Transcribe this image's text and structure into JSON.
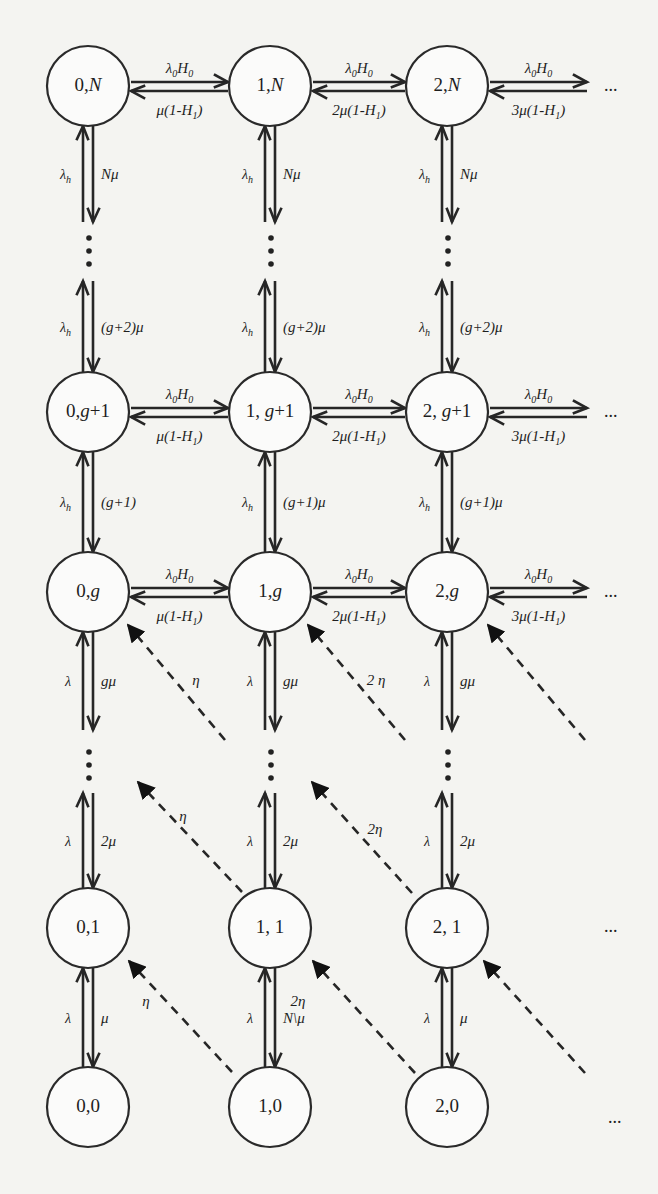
{
  "diagram": {
    "colors": {
      "background": "#f4f4f1",
      "stroke": "#262626",
      "node_fill": "#fbfbfa"
    },
    "columns_x": [
      88,
      270,
      447
    ],
    "rows": [
      {
        "id": "N",
        "y": 86,
        "labels": [
          "0,N",
          "1,N",
          "2,N"
        ]
      },
      {
        "id": "g+1",
        "y": 412,
        "labels": [
          "0,g+1",
          "1, g+1",
          "2, g+1"
        ]
      },
      {
        "id": "g",
        "y": 592,
        "labels": [
          "0,g",
          "1,g",
          "2,g"
        ]
      },
      {
        "id": "1",
        "y": 928,
        "labels": [
          "0,1",
          "1, 1",
          "2, 1"
        ]
      },
      {
        "id": "0",
        "y": 1107,
        "labels": [
          "0,0",
          "1,0",
          "2,0"
        ]
      }
    ],
    "horizontal_rates": {
      "N": {
        "forward": [
          "λ0H0",
          "λ0H0",
          "λ0H0"
        ],
        "backward": [
          "μ(1-H1)",
          "2μ(1-H1)",
          "3μ(1-H1)"
        ]
      },
      "g+1": {
        "forward": [
          "λ0H0",
          "λ0H0",
          "λ0H0"
        ],
        "backward": [
          "μ(1-H1)",
          "2μ(1-H1)",
          "3μ(1-H1)"
        ]
      },
      "g": {
        "forward": [
          "λ0H0",
          "λ0H0",
          "λ0H0"
        ],
        "backward": [
          "μ(1-H1)",
          "2μ(1-H1)",
          "3μ(1-H1)"
        ]
      }
    },
    "vertical_rates": {
      "N_to_dots": {
        "up": [
          "λh",
          "λh",
          "λh"
        ],
        "down": [
          "Nμ",
          "Nμ",
          "Nμ"
        ]
      },
      "dots_to_g+1": {
        "up": [
          "λh",
          "λh",
          "λh"
        ],
        "down": [
          "(g+2)μ",
          "(g+2)μ",
          "(g+2)μ"
        ]
      },
      "g+1_to_g": {
        "up": [
          "λh",
          "λh",
          "λh"
        ],
        "down": [
          "(g+1)",
          "(g+1)μ",
          "(g+1)μ"
        ]
      },
      "g_to_dots": {
        "up": [
          "λ",
          "λ",
          "λ"
        ],
        "down": [
          "gμ",
          "gμ",
          "gμ"
        ]
      },
      "dots_to_1": {
        "up": [
          "λ",
          "λ",
          "λ"
        ],
        "down": [
          "2μ",
          "2μ",
          "2μ"
        ]
      },
      "1_to_0": {
        "up": [
          "λ",
          "λ",
          "λ"
        ],
        "down": [
          "μ",
          "N\\μ",
          "μ"
        ]
      }
    },
    "diagonal_rates": {
      "to_row_g": [
        "η",
        "2 η",
        ""
      ],
      "to_dots": [
        "η",
        "2η"
      ],
      "to_row_1": [
        "η",
        "2η",
        ""
      ]
    },
    "continuation": "..."
  }
}
